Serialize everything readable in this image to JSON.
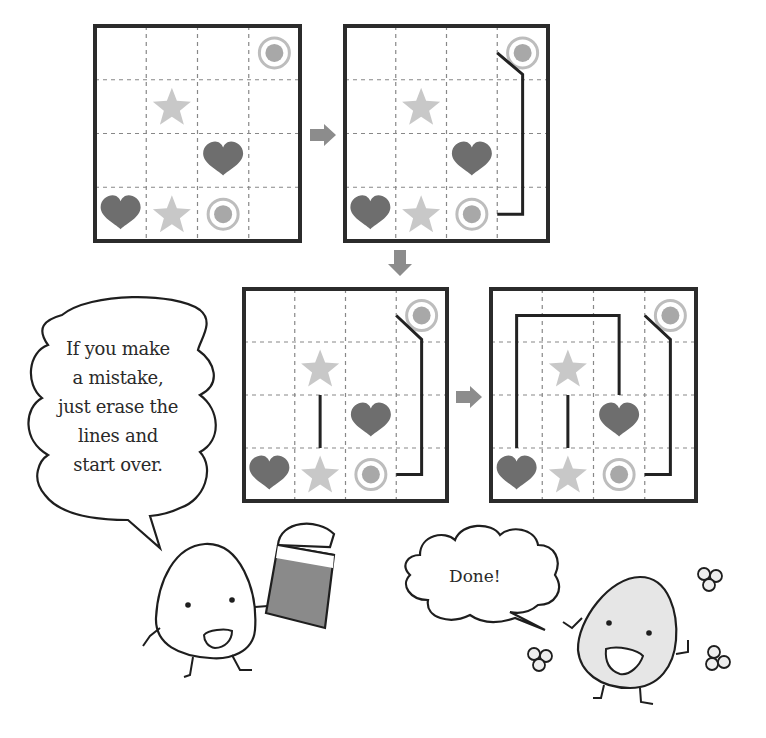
{
  "colors": {
    "grid_border": "#2b2b2b",
    "grid_dash": "#888888",
    "heart": "#6e6e6e",
    "star": "#c8c8c8",
    "circle_ring": "#bdbdbd",
    "circle_fill": "#a8a8a8",
    "path_line": "#222222",
    "arrow": "#8c8c8c",
    "eraser_body": "#8a8a8a",
    "happy_body": "#e6e6e6"
  },
  "puzzle": {
    "rows": 4,
    "cols": 4,
    "symbols": [
      {
        "type": "circle",
        "row": 0,
        "col": 3
      },
      {
        "type": "star",
        "row": 1,
        "col": 1
      },
      {
        "type": "heart",
        "row": 2,
        "col": 2
      },
      {
        "type": "heart",
        "row": 3,
        "col": 0
      },
      {
        "type": "star",
        "row": 3,
        "col": 1
      },
      {
        "type": "circle",
        "row": 3,
        "col": 2
      }
    ]
  },
  "steps": [
    {
      "id": "step-1",
      "x": 95,
      "y": 26,
      "w": 205,
      "h": 215,
      "paths": []
    },
    {
      "id": "step-2",
      "x": 345,
      "y": 26,
      "w": 203,
      "h": 215,
      "paths": [
        [
          [
            3,
            0.5
          ],
          [
            3.5,
            0.9
          ],
          [
            3.5,
            3.5
          ],
          [
            3,
            3.5
          ]
        ]
      ]
    },
    {
      "id": "step-3",
      "x": 244,
      "y": 289,
      "w": 203,
      "h": 212,
      "paths": [
        [
          [
            3,
            0.5
          ],
          [
            3.5,
            0.95
          ],
          [
            3.5,
            3.5
          ],
          [
            3,
            3.5
          ]
        ],
        [
          [
            1.5,
            2
          ],
          [
            1.5,
            3
          ]
        ]
      ]
    },
    {
      "id": "step-4",
      "x": 491,
      "y": 289,
      "w": 205,
      "h": 212,
      "paths": [
        [
          [
            3,
            0.5
          ],
          [
            3.5,
            0.95
          ],
          [
            3.5,
            3.5
          ],
          [
            3,
            3.5
          ]
        ],
        [
          [
            1.5,
            2
          ],
          [
            1.5,
            3
          ]
        ],
        [
          [
            0.5,
            3
          ],
          [
            0.5,
            0.5
          ],
          [
            2.5,
            0.5
          ],
          [
            2.5,
            2
          ]
        ]
      ]
    }
  ],
  "arrows": [
    {
      "id": "arrow-right-1",
      "dir": "right",
      "x": 310,
      "y": 124
    },
    {
      "id": "arrow-down",
      "dir": "down",
      "x": 388,
      "y": 250
    },
    {
      "id": "arrow-right-2",
      "dir": "right",
      "x": 456,
      "y": 386
    }
  ],
  "speech_left": {
    "lines": [
      "If you make",
      "a mistake,",
      "just erase the",
      "lines and",
      "start over."
    ]
  },
  "speech_right": {
    "text": "Done!"
  }
}
